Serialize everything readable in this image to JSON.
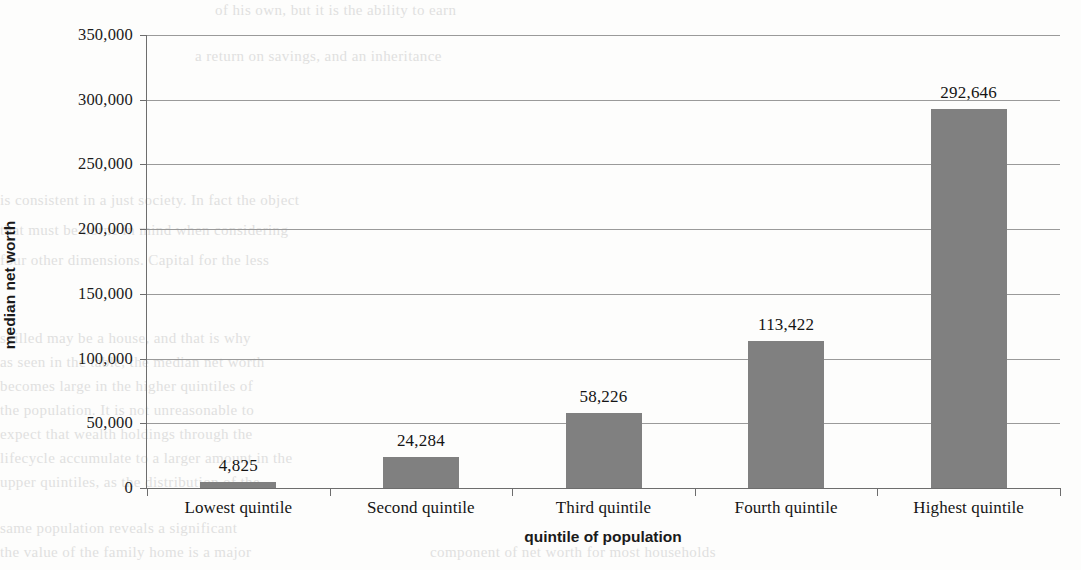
{
  "chart_data": {
    "type": "bar",
    "title": "",
    "xlabel": "quintile of population",
    "ylabel": "median net worth",
    "categories": [
      "Lowest quintile",
      "Second quintile",
      "Third quintile",
      "Fourth quintile",
      "Highest quintile"
    ],
    "values": [
      4825,
      24284,
      58226,
      113422,
      292646
    ],
    "value_labels": [
      "4,825",
      "24,284",
      "58,226",
      "113,422",
      "292,646"
    ],
    "ylim": [
      0,
      350000
    ],
    "ytick_values": [
      0,
      50000,
      100000,
      150000,
      200000,
      250000,
      300000,
      350000
    ],
    "ytick_labels": [
      "0",
      "50,000",
      "100,000",
      "150,000",
      "200,000",
      "250,000",
      "300,000",
      "350,000"
    ],
    "grid": true,
    "legend": "none",
    "series": [
      {
        "name": "median net worth",
        "color": "#808080",
        "values": [
          4825,
          24284,
          58226,
          113422,
          292646
        ]
      }
    ]
  },
  "colors": {
    "bar": "#808080",
    "gridline": "#9a9a9a",
    "axis": "#6d6d6d",
    "text": "#151515",
    "background": "#fdfdfc",
    "bleed_text": "#c9c9c9"
  },
  "background_bleed": {
    "note": "faint mirrored text from reverse of scanned page",
    "lines": [
      "of his own, but it is the ability to earn",
      "a return on savings, and an inheritance",
      "is consistent in a just society. In fact the object",
      "that must be borne in mind when considering",
      "four other dimensions. Capital for the less",
      "skilled may be a house, and that is why",
      "as seen in the table, the median net worth",
      "becomes large in the higher quintiles of",
      "the population. It is not unreasonable to",
      "expect that wealth holdings through the",
      "lifecycle accumulate to a larger amount in the",
      "upper quintiles, as the distribution of the",
      "same population reveals a significant",
      "the value of the family home is a major",
      "component of net worth for most households"
    ]
  }
}
